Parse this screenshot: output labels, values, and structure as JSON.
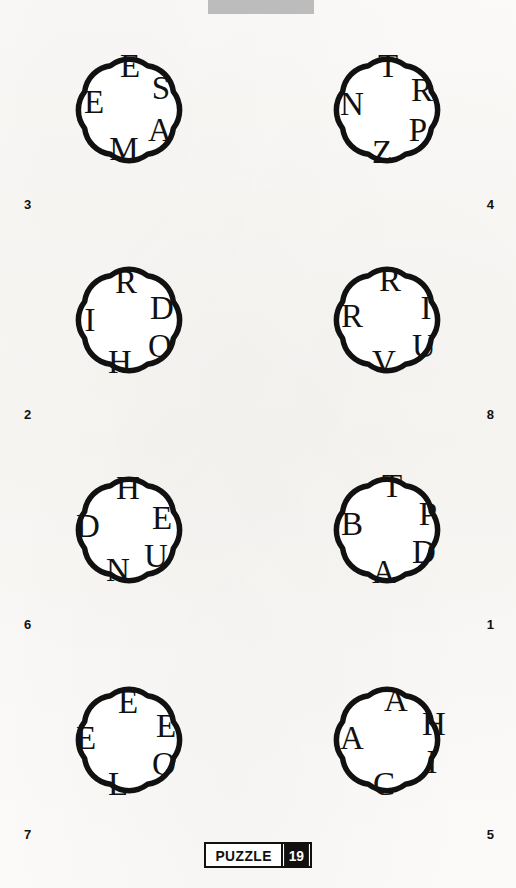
{
  "page": {
    "background_color": "#faf9f7",
    "ink_color": "#111111",
    "top_bar_color": "#bcbcbc"
  },
  "footer": {
    "badge_word": "PUZZLE",
    "badge_number": "19"
  },
  "puzzles": [
    {
      "number": "3",
      "number_position": "left",
      "letters": [
        {
          "char": "E",
          "x": 90,
          "y": 40
        },
        {
          "char": "S",
          "x": 121,
          "y": 62
        },
        {
          "char": "A",
          "x": 120,
          "y": 104
        },
        {
          "char": "M",
          "x": 84,
          "y": 123
        },
        {
          "char": "E",
          "x": 54,
          "y": 76
        }
      ]
    },
    {
      "number": "4",
      "number_position": "right",
      "letters": [
        {
          "char": "T",
          "x": 90,
          "y": 40
        },
        {
          "char": "R",
          "x": 124,
          "y": 64
        },
        {
          "char": "P",
          "x": 120,
          "y": 104
        },
        {
          "char": "Z",
          "x": 84,
          "y": 126
        },
        {
          "char": "N",
          "x": 54,
          "y": 78
        }
      ]
    },
    {
      "number": "2",
      "number_position": "left",
      "letters": [
        {
          "char": "R",
          "x": 86,
          "y": 46
        },
        {
          "char": "D",
          "x": 122,
          "y": 72
        },
        {
          "char": "O",
          "x": 120,
          "y": 110
        },
        {
          "char": "H",
          "x": 80,
          "y": 126
        },
        {
          "char": "I",
          "x": 50,
          "y": 84
        }
      ]
    },
    {
      "number": "8",
      "number_position": "right",
      "letters": [
        {
          "char": "R",
          "x": 92,
          "y": 44
        },
        {
          "char": "I",
          "x": 128,
          "y": 72
        },
        {
          "char": "U",
          "x": 126,
          "y": 110
        },
        {
          "char": "V",
          "x": 86,
          "y": 126
        },
        {
          "char": "R",
          "x": 54,
          "y": 80
        }
      ]
    },
    {
      "number": "6",
      "number_position": "left",
      "letters": [
        {
          "char": "H",
          "x": 88,
          "y": 42
        },
        {
          "char": "E",
          "x": 122,
          "y": 72
        },
        {
          "char": "U",
          "x": 116,
          "y": 110
        },
        {
          "char": "N",
          "x": 78,
          "y": 124
        },
        {
          "char": "D",
          "x": 48,
          "y": 80
        }
      ]
    },
    {
      "number": "1",
      "number_position": "right",
      "letters": [
        {
          "char": "T",
          "x": 94,
          "y": 40
        },
        {
          "char": "P",
          "x": 130,
          "y": 68
        },
        {
          "char": "D",
          "x": 126,
          "y": 106
        },
        {
          "char": "A",
          "x": 86,
          "y": 126
        },
        {
          "char": "B",
          "x": 54,
          "y": 78
        }
      ]
    },
    {
      "number": "7",
      "number_position": "left",
      "letters": [
        {
          "char": "E",
          "x": 88,
          "y": 46
        },
        {
          "char": "E",
          "x": 126,
          "y": 70
        },
        {
          "char": "O",
          "x": 124,
          "y": 108
        },
        {
          "char": "L",
          "x": 78,
          "y": 128
        },
        {
          "char": "E",
          "x": 46,
          "y": 82
        }
      ]
    },
    {
      "number": "5",
      "number_position": "right",
      "letters": [
        {
          "char": "A",
          "x": 98,
          "y": 44
        },
        {
          "char": "H",
          "x": 136,
          "y": 68
        },
        {
          "char": "I",
          "x": 134,
          "y": 106
        },
        {
          "char": "C",
          "x": 86,
          "y": 128
        },
        {
          "char": "A",
          "x": 54,
          "y": 82
        }
      ]
    }
  ]
}
